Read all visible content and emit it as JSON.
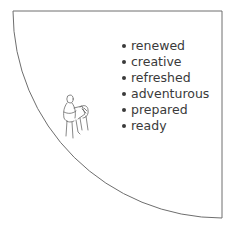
{
  "diagram": {
    "shape": "quarter-circle",
    "stroke_color": "#6e6e6e",
    "text_color": "#3a3a3a",
    "list_items": [
      {
        "label": "renewed"
      },
      {
        "label": "creative"
      },
      {
        "label": "refreshed"
      },
      {
        "label": "adventurous"
      },
      {
        "label": "prepared"
      },
      {
        "label": "ready"
      }
    ],
    "illustration": "sketch-person-reading-icon"
  }
}
